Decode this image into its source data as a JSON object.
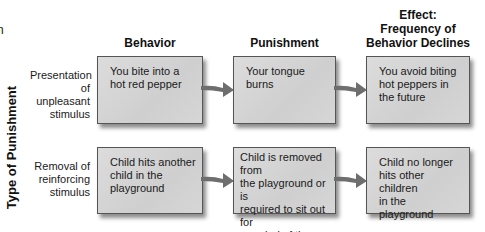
{
  "partial_text": "n",
  "axis_label": "Type of Punishment",
  "columns": [
    {
      "header": "Behavior"
    },
    {
      "header": "Punishment"
    },
    {
      "header_lines": [
        "Effect:",
        "Frequency of",
        "Behavior Declines"
      ]
    }
  ],
  "rows": [
    {
      "label_lines": [
        "Presentation",
        "of unpleasant",
        "stimulus"
      ],
      "behavior": [
        "You bite into a",
        "hot red pepper"
      ],
      "punishment": [
        "Your tongue",
        "burns"
      ],
      "effect": [
        "You avoid biting",
        "hot peppers in",
        "the future"
      ]
    },
    {
      "label_lines": [
        "Removal of",
        "reinforcing",
        "stimulus"
      ],
      "behavior": [
        "Child hits another",
        "child in the",
        "playground"
      ],
      "punishment": [
        "Child is removed from",
        "the playground or is",
        "required to sit out for",
        "a period of time"
      ],
      "effect": [
        "Child no longer",
        "hits other children",
        "in the playground"
      ]
    }
  ],
  "colors": {
    "box_fill": "#d4d4d4",
    "box_border": "#555555",
    "arrow_fill": "#6e6e6e",
    "text": "#1a1a1a"
  },
  "icons": {
    "arrow": "right-arrow-icon"
  }
}
